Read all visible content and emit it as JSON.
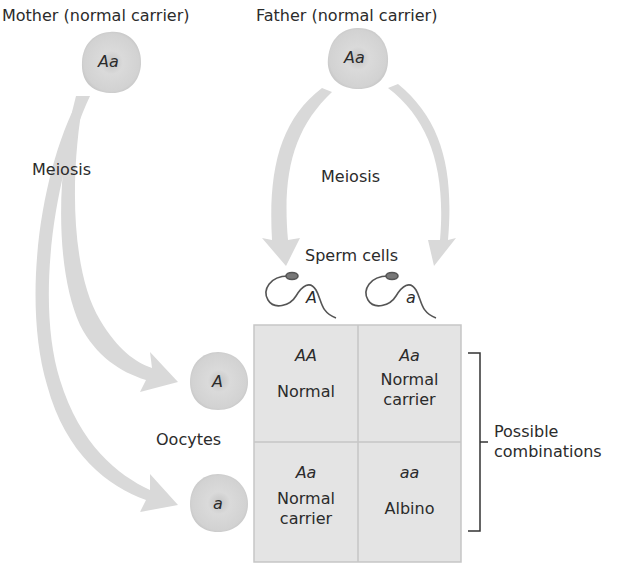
{
  "parents": {
    "mother": {
      "label": "Mother (normal carrier)",
      "genotype": "Aa"
    },
    "father": {
      "label": "Father (normal carrier)",
      "genotype": "Aa"
    }
  },
  "process": {
    "mother_label": "Meiosis",
    "father_label": "Meiosis"
  },
  "gametes": {
    "sperm_label": "Sperm cells",
    "sperm": [
      {
        "allele": "A"
      },
      {
        "allele": "a"
      }
    ],
    "oocyte_label": "Oocytes",
    "oocytes": [
      {
        "allele": "A"
      },
      {
        "allele": "a"
      }
    ]
  },
  "punnett": {
    "cells": [
      {
        "genotype": "AA",
        "phenotype_line1": "Normal",
        "phenotype_line2": ""
      },
      {
        "genotype": "Aa",
        "phenotype_line1": "Normal",
        "phenotype_line2": "carrier"
      },
      {
        "genotype": "Aa",
        "phenotype_line1": "Normal",
        "phenotype_line2": "carrier"
      },
      {
        "genotype": "aa",
        "phenotype_line1": "Albino",
        "phenotype_line2": ""
      }
    ],
    "bracket_label_line1": "Possible",
    "bracket_label_line2": "combinations"
  },
  "colors": {
    "arrow": "#d9d9d9",
    "cell_fill": "#d4d4d4",
    "cell_nucleus": "#bdbdbd",
    "grid_fill": "#e4e4e4",
    "grid_line": "#c6c6c6",
    "text": "#2b2b2b",
    "sperm": "#555555"
  }
}
